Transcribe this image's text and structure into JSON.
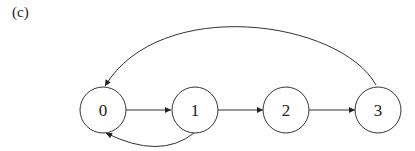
{
  "panel_label": "(c)",
  "nodes": [
    {
      "id": "0",
      "label": "0"
    },
    {
      "id": "1",
      "label": "1"
    },
    {
      "id": "2",
      "label": "2"
    },
    {
      "id": "3",
      "label": "3"
    }
  ],
  "edges": [
    {
      "from": "0",
      "to": "1"
    },
    {
      "from": "1",
      "to": "2"
    },
    {
      "from": "2",
      "to": "3"
    },
    {
      "from": "1",
      "to": "0"
    },
    {
      "from": "3",
      "to": "0"
    }
  ],
  "colors": {
    "stroke": "#333333",
    "background": "#ffffff"
  }
}
